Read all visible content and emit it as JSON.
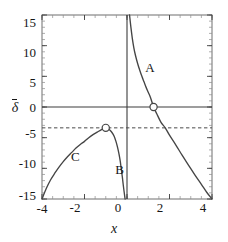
{
  "chart_data": {
    "type": "line",
    "title": "",
    "xlabel": "x",
    "ylabel": "δ",
    "ylabel_has_overbar": true,
    "xlim": [
      -4,
      4
    ],
    "ylim": [
      -15,
      15
    ],
    "xticks": [
      -4,
      -2,
      0,
      2,
      4
    ],
    "xtick_labels": [
      "-4",
      "-2",
      "0",
      "2",
      "4"
    ],
    "yticks": [
      -15,
      -10,
      -5,
      0,
      5,
      10,
      15
    ],
    "ytick_labels": [
      "-15",
      "-10",
      "-5",
      "0",
      "5",
      "10",
      "15"
    ],
    "grid": false,
    "legend": "none",
    "frame": true,
    "minor_ticks": true,
    "reference_lines": [
      {
        "name": "zero-axis",
        "orientation": "horizontal",
        "value": 0,
        "style": "solid"
      },
      {
        "name": "vertical-axis",
        "orientation": "vertical",
        "value": 0,
        "style": "solid"
      },
      {
        "name": "delta-bar-level",
        "orientation": "horizontal",
        "value": -3.4,
        "style": "dashed"
      }
    ],
    "series": [
      {
        "name": "A",
        "label": "A",
        "label_position": [
          1.05,
          6.4
        ],
        "style": "solid",
        "points": [
          [
            0.12,
            15.0
          ],
          [
            0.18,
            13.1
          ],
          [
            0.25,
            11.2
          ],
          [
            0.32,
            9.7
          ],
          [
            0.4,
            8.4
          ],
          [
            0.5,
            7.1
          ],
          [
            0.6,
            6.0
          ],
          [
            0.7,
            5.0
          ],
          [
            0.8,
            4.1
          ],
          [
            0.9,
            3.2
          ],
          [
            1.0,
            2.4
          ],
          [
            1.1,
            1.6
          ],
          [
            1.25,
            0.0
          ],
          [
            1.4,
            -1.1
          ],
          [
            1.6,
            -2.5
          ],
          [
            1.8,
            -3.4
          ],
          [
            2.0,
            -4.6
          ],
          [
            2.3,
            -6.2
          ],
          [
            2.6,
            -7.9
          ],
          [
            2.9,
            -9.5
          ],
          [
            3.2,
            -11.1
          ],
          [
            3.5,
            -12.6
          ],
          [
            3.75,
            -13.9
          ],
          [
            4.0,
            -15.0
          ]
        ]
      },
      {
        "name": "B",
        "label": "B",
        "label_position": [
          -0.37,
          -10.2
        ],
        "style": "solid",
        "points": [
          [
            -1.0,
            -3.4
          ],
          [
            -0.9,
            -3.5
          ],
          [
            -0.8,
            -3.8
          ],
          [
            -0.7,
            -4.2
          ],
          [
            -0.6,
            -4.8
          ],
          [
            -0.52,
            -5.6
          ],
          [
            -0.45,
            -6.5
          ],
          [
            -0.38,
            -7.6
          ],
          [
            -0.32,
            -8.8
          ],
          [
            -0.27,
            -10.1
          ],
          [
            -0.22,
            -11.4
          ],
          [
            -0.18,
            -12.6
          ],
          [
            -0.14,
            -13.7
          ],
          [
            -0.11,
            -14.5
          ],
          [
            -0.09,
            -15.0
          ]
        ]
      },
      {
        "name": "C",
        "label": "C",
        "label_position": [
          -2.45,
          -8.1
        ],
        "style": "solid",
        "points": [
          [
            -4.0,
            -15.0
          ],
          [
            -3.8,
            -13.3
          ],
          [
            -3.6,
            -11.9
          ],
          [
            -3.4,
            -10.8
          ],
          [
            -3.2,
            -9.8
          ],
          [
            -3.0,
            -8.9
          ],
          [
            -2.8,
            -8.1
          ],
          [
            -2.6,
            -7.4
          ],
          [
            -2.4,
            -6.7
          ],
          [
            -2.2,
            -6.1
          ],
          [
            -2.0,
            -5.6
          ],
          [
            -1.8,
            -5.0
          ],
          [
            -1.6,
            -4.5
          ],
          [
            -1.4,
            -4.1
          ],
          [
            -1.2,
            -3.7
          ],
          [
            -1.0,
            -3.4
          ]
        ]
      }
    ],
    "markers": [
      {
        "name": "root-marker-a",
        "x": 1.25,
        "y": 0.0,
        "shape": "open-circle",
        "on_series": "A"
      },
      {
        "name": "tangency-marker-bc",
        "x": -1.0,
        "y": -3.4,
        "shape": "open-circle",
        "on_series": "C"
      }
    ],
    "colors": {
      "curve": "#454545",
      "axis": "#3c3c3c",
      "frame": "#6e6e6e",
      "dashed": "#4a4a4a",
      "text": "#161616",
      "background": "#ffffff"
    }
  }
}
